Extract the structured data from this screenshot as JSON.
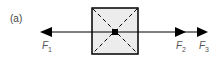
{
  "figure": {
    "label": "(a)",
    "forces": [
      {
        "symbol": "F",
        "subscript": "1",
        "direction": "left"
      },
      {
        "symbol": "F",
        "subscript": "2",
        "direction": "right"
      },
      {
        "symbol": "F",
        "subscript": "3",
        "direction": "right"
      }
    ],
    "colors": {
      "box_fill": "#ececec",
      "line": "#000000",
      "label": "#555555"
    }
  }
}
